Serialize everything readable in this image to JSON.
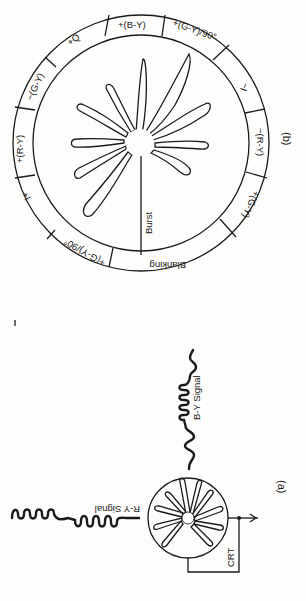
{
  "figure_b": {
    "caption": "(b)",
    "ring_segments": [
      {
        "label": "+(B-Y)"
      },
      {
        "label": "+(G-Y)/90°"
      },
      {
        "label": "−I"
      },
      {
        "label": "−(R-Y)"
      },
      {
        "label": "+(G-Y)"
      },
      {
        "label": "Blanking"
      },
      {
        "label": "+(G-Y)/90°"
      },
      {
        "label": "I+"
      },
      {
        "label": "+(R-Y)"
      },
      {
        "label": "−(G-Y)"
      },
      {
        "label": "+Q"
      }
    ],
    "burst_label": "Burst"
  },
  "figure_a": {
    "caption": "(a)",
    "ry_signal_label": "R-Y Signal",
    "by_signal_label": "B-Y Signal",
    "crt_label": "CRT"
  }
}
